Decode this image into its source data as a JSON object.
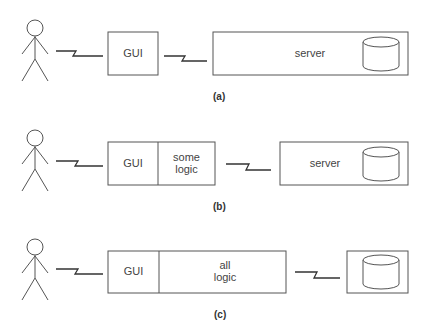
{
  "figure": {
    "panels": [
      {
        "caption": "(a)",
        "client_boxes": [
          "GUI"
        ],
        "server_label": "server",
        "has_database": true
      },
      {
        "caption": "(b)",
        "client_boxes": [
          "GUI",
          "some logic"
        ],
        "client_box_lines": [
          [
            "GUI"
          ],
          [
            "some",
            "logic"
          ]
        ],
        "server_label": "server",
        "has_database": true
      },
      {
        "caption": "(c)",
        "client_boxes": [
          "GUI",
          "all logic"
        ],
        "client_box_lines": [
          [
            "GUI"
          ],
          [
            "all",
            "logic"
          ]
        ],
        "server_label": "",
        "has_database": true
      }
    ]
  },
  "a": {
    "gui": "GUI",
    "server": "server",
    "caption": "(a)"
  },
  "b": {
    "gui": "GUI",
    "logic1": "some",
    "logic2": "logic",
    "server": "server",
    "caption": "(b)"
  },
  "c": {
    "gui": "GUI",
    "logic1": "all",
    "logic2": "logic",
    "caption": "(c)"
  },
  "colors": {
    "stroke": "#555555",
    "text": "#444444",
    "background": "#ffffff"
  }
}
